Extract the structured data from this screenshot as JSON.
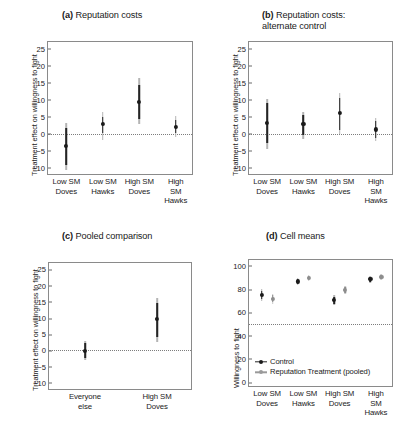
{
  "figure": {
    "panels": [
      {
        "tag": "(a)",
        "title": "Reputation costs",
        "title_full": "(a) Reputation costs",
        "ylabel": "Treatment effect on willingness to fight"
      },
      {
        "tag": "(b)",
        "title": "Reputation costs:\nalternate control",
        "title_full": "(b) Reputation costs: alternate control",
        "ylabel": "Treatment effect on willingness to fight"
      },
      {
        "tag": "(c)",
        "title": "Pooled comparison",
        "title_full": "(c) Pooled comparison",
        "ylabel": "Treatment effect on willingness to fight"
      },
      {
        "tag": "(d)",
        "title": "Cell means",
        "title_full": "(d) Cell means",
        "ylabel": "Willingness to fight"
      }
    ]
  },
  "chart_data": [
    {
      "id": "panel-a",
      "type": "scatter",
      "title": "(a) Reputation costs",
      "xlabel": "",
      "ylabel": "Treatment effect on willingness to fight",
      "ylim": [
        -12.5,
        27
      ],
      "yticks": [
        -10,
        -5,
        0,
        5,
        10,
        15,
        20,
        25
      ],
      "ytick_labels": [
        "−10",
        "−5",
        "0",
        "5",
        "10",
        "15",
        "20",
        "25"
      ],
      "grid": false,
      "reference_line": 0,
      "reference_line_style": "dotted",
      "categories": [
        "Low SM\nDoves",
        "Low SM\nHawks",
        "High SM\nDoves",
        "High SM\nHawks"
      ],
      "series": [
        {
          "name": "Treatment effect",
          "color": "#242424",
          "values": [
            -3.7,
            2.8,
            9.3,
            2.0
          ],
          "ci_inner_low": [
            -9.2,
            0.2,
            4.3,
            0.2
          ],
          "ci_inner_high": [
            1.6,
            5.0,
            14.3,
            4.0
          ],
          "ci_outer_low": [
            -10.6,
            -1.8,
            2.9,
            -0.9
          ],
          "ci_outer_high": [
            3.1,
            6.4,
            16.4,
            5.3
          ]
        }
      ]
    },
    {
      "id": "panel-b",
      "type": "scatter",
      "title": "(b) Reputation costs: alternate control",
      "xlabel": "",
      "ylabel": "Treatment effect on willingness to fight",
      "ylim": [
        -12.5,
        27
      ],
      "yticks": [
        -10,
        -5,
        0,
        5,
        10,
        15,
        20,
        25
      ],
      "ytick_labels": [
        "−10",
        "−5",
        "0",
        "5",
        "10",
        "15",
        "20",
        "25"
      ],
      "grid": false,
      "reference_line": 0,
      "reference_line_style": "dotted",
      "categories": [
        "Low SM\nDoves",
        "Low SM\nHawks",
        "High SM\nDoves",
        "High SM\nHawks"
      ],
      "series": [
        {
          "name": "Treatment effect",
          "color": "#242424",
          "values": [
            3.1,
            2.8,
            6.0,
            1.2
          ],
          "ci_inner_low": [
            -2.8,
            -0.4,
            1.2,
            -1.2
          ],
          "ci_inner_high": [
            9.0,
            5.6,
            10.6,
            3.6
          ],
          "ci_outer_low": [
            -4.4,
            -1.5,
            0.0,
            -2.3
          ],
          "ci_outer_high": [
            10.3,
            6.4,
            12.0,
            4.6
          ]
        }
      ]
    },
    {
      "id": "panel-c",
      "type": "scatter",
      "title": "(c) Pooled comparison",
      "xlabel": "",
      "ylabel": "Treatment effect on willingness to fight",
      "ylim": [
        -12.5,
        27
      ],
      "yticks": [
        -10,
        -5,
        0,
        5,
        10,
        15,
        20,
        25
      ],
      "ytick_labels": [
        "−10",
        "−5",
        "0",
        "5",
        "10",
        "15",
        "20",
        "25"
      ],
      "grid": false,
      "reference_line": 0,
      "reference_line_style": "dotted",
      "categories": [
        "Everyone\nelse",
        "High SM\nDoves"
      ],
      "series": [
        {
          "name": "Treatment effect",
          "color": "#242424",
          "values": [
            -0.1,
            9.6
          ],
          "ci_inner_low": [
            -2.2,
            4.3
          ],
          "ci_inner_high": [
            2.2,
            14.6
          ],
          "ci_outer_low": [
            -2.9,
            2.5
          ],
          "ci_outer_high": [
            2.9,
            16.3
          ]
        }
      ]
    },
    {
      "id": "panel-d",
      "type": "scatter",
      "title": "(d) Cell means",
      "xlabel": "",
      "ylabel": "Willingness to fight",
      "ylim": [
        -5,
        105
      ],
      "yticks": [
        0,
        20,
        40,
        60,
        80,
        100
      ],
      "ytick_labels": [
        "0",
        "20",
        "40",
        "60",
        "80",
        "100"
      ],
      "grid": false,
      "reference_line": 50,
      "reference_line_style": "dotted",
      "legend_position": "bottom-left",
      "categories": [
        "Low SM\nDoves",
        "Low SM\nHawks",
        "High SM\nDoves",
        "High SM\nHawks"
      ],
      "series": [
        {
          "name": "Control",
          "color": "#242424",
          "values": [
            75.0,
            86.5,
            70.5,
            88.5
          ],
          "ci_inner_low": [
            71.5,
            84.5,
            67.5,
            86.5
          ],
          "ci_inner_high": [
            78.5,
            88.5,
            73.5,
            90.5
          ],
          "ci_outer_low": [
            70.0,
            83.5,
            66.0,
            85.5
          ],
          "ci_outer_high": [
            80.0,
            89.5,
            75.0,
            91.5
          ]
        },
        {
          "name": "Reputation Treatment (pooled)",
          "color": "#8d8d8d",
          "values": [
            71.5,
            89.5,
            79.5,
            90.5
          ],
          "ci_inner_low": [
            68.5,
            88.0,
            77.0,
            89.0
          ],
          "ci_inner_high": [
            74.5,
            91.0,
            82.0,
            92.0
          ],
          "ci_outer_low": [
            67.0,
            87.0,
            76.0,
            88.0
          ],
          "ci_outer_high": [
            76.0,
            92.0,
            83.0,
            93.0
          ]
        }
      ]
    }
  ]
}
